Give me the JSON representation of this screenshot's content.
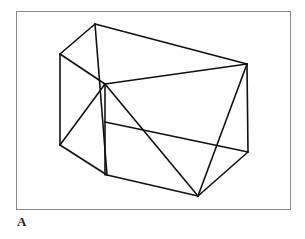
{
  "figure": {
    "panel_label": "A",
    "caption": "",
    "frame": {
      "x": 16,
      "y": 11,
      "width": 275,
      "height": 199,
      "border_color": "#8a8a8a",
      "background_color": "#ffffff"
    },
    "drawing": {
      "title": "Wireframe polyhedron line drawing",
      "type": "line-drawing",
      "stroke_color": "#111111",
      "stroke_width": 1.6,
      "fill": "none",
      "vertices": {
        "top_apex": [
          95,
          24
        ],
        "top_left": [
          60,
          54
        ],
        "top_right": [
          247,
          64
        ],
        "mid_center": [
          105,
          84
        ],
        "mid_left_lower": [
          60,
          145
        ],
        "lower_center": [
          107,
          175
        ],
        "bottom_right": [
          248,
          152
        ],
        "bottom_apex": [
          198,
          196
        ],
        "vertical_top": [
          95,
          24
        ],
        "vertical_bottom": [
          107,
          175
        ]
      },
      "edges": [
        [
          60,
          54,
          95,
          24
        ],
        [
          95,
          24,
          247,
          64
        ],
        [
          60,
          54,
          105,
          84
        ],
        [
          105,
          84,
          247,
          64
        ],
        [
          95,
          24,
          107,
          175
        ],
        [
          60,
          54,
          60,
          145
        ],
        [
          105,
          84,
          105,
          175
        ],
        [
          60,
          145,
          107,
          175
        ],
        [
          107,
          175,
          198,
          196
        ],
        [
          60,
          145,
          105,
          84
        ],
        [
          105,
          84,
          198,
          196
        ],
        [
          247,
          64,
          248,
          152
        ],
        [
          247,
          64,
          198,
          196
        ],
        [
          248,
          152,
          198,
          196
        ],
        [
          105,
          122,
          248,
          152
        ]
      ]
    }
  }
}
